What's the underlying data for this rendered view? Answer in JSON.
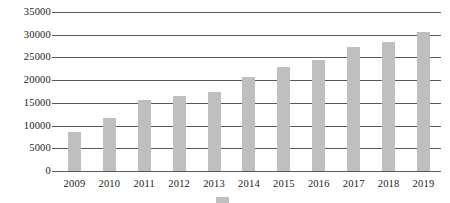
{
  "chart_data": {
    "type": "bar",
    "title": "",
    "subtitle": "",
    "xlabel": "",
    "ylabel": "",
    "categories": [
      "2009",
      "2010",
      "2011",
      "2012",
      "2013",
      "2014",
      "2015",
      "2016",
      "2017",
      "2018",
      "2019"
    ],
    "values": [
      8600,
      11700,
      15700,
      16600,
      17500,
      20800,
      22800,
      24500,
      27300,
      28300,
      30600
    ],
    "series": [
      {
        "name": "",
        "values": [
          8600,
          11700,
          15700,
          16600,
          17500,
          20800,
          22800,
          24500,
          27300,
          28300,
          30600
        ],
        "color": "#bfbfbf"
      }
    ],
    "ylim": [
      0,
      35000
    ],
    "yticks": [
      0,
      5000,
      10000,
      15000,
      20000,
      25000,
      30000,
      35000
    ],
    "ytick_labels": [
      "0",
      "5000",
      "10000",
      "15000",
      "20000",
      "25000",
      "30000",
      "35000"
    ],
    "grid": true,
    "grid_axis": "y",
    "legend_position": "bottom",
    "annotations": []
  },
  "axes": {
    "y": {
      "ticks": [
        {
          "label": "35000",
          "value": 35000
        },
        {
          "label": "30000",
          "value": 30000
        },
        {
          "label": "25000",
          "value": 25000
        },
        {
          "label": "20000",
          "value": 20000
        },
        {
          "label": "15000",
          "value": 15000
        },
        {
          "label": "10000",
          "value": 10000
        },
        {
          "label": "5000",
          "value": 5000
        },
        {
          "label": "0",
          "value": 0
        }
      ]
    },
    "x": {
      "ticks": [
        "2009",
        "2010",
        "2011",
        "2012",
        "2013",
        "2014",
        "2015",
        "2016",
        "2017",
        "2018",
        "2019"
      ]
    }
  },
  "legend": {
    "swatch_color": "#bfbfbf",
    "label": ""
  },
  "colors": {
    "bar": "#bfbfbf",
    "gridline": "#58595b",
    "text": "#1a1a1a",
    "background": "#ffffff"
  }
}
